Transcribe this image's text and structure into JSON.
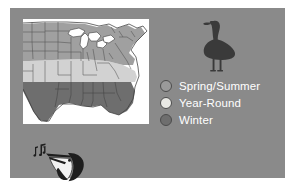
{
  "panel": {
    "background_color": "#8a8a8a",
    "page_background_color": "#ffffff"
  },
  "map": {
    "name": "range-map-united-states",
    "plate_color": "#ffffff",
    "outline_color": "#3d3d3d",
    "region_label": "Eastern United States range map",
    "bands": [
      {
        "key": "spring_summer",
        "label": "Spring/Summer",
        "color": "#a0a0a0"
      },
      {
        "key": "year_round",
        "label": "Year-Round",
        "color": "#d2d2d2"
      },
      {
        "key": "winter",
        "label": "Winter",
        "color": "#6e6e6e"
      }
    ]
  },
  "bird": {
    "silhouette_name": "goose-silhouette",
    "silhouette_color": "#3a3a3a",
    "species_common": "Goose"
  },
  "legend": {
    "name": "seasonal-range-legend",
    "text_color": "#ffffff",
    "swatch_border_color": "#4c4c4c",
    "items": [
      {
        "label": "Spring/Summer",
        "color": "#9a9a9a"
      },
      {
        "label": "Year-Round",
        "color": "#e8e8e4"
      },
      {
        "label": "Winter",
        "color": "#6e6e6e"
      }
    ]
  },
  "audio": {
    "name": "bird-call-audio-icon",
    "label": "Bird call",
    "note_glyph": "♫",
    "head_dark_color": "#1e1e1e",
    "head_light_color": "#f2f2f2"
  }
}
